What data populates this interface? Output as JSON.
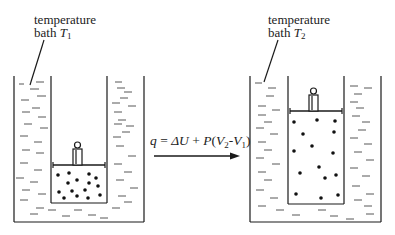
{
  "diagram": {
    "left_setup": {
      "label_line1": "temperature",
      "label_line2": "bath ",
      "temperature_symbol": "T",
      "temperature_subscript": "1",
      "state": "compressed gas, small volume"
    },
    "right_setup": {
      "label_line1": "temperature",
      "label_line2": "bath ",
      "temperature_symbol": "T",
      "temperature_subscript": "2",
      "state": "expanded gas, large volume"
    },
    "process": {
      "q": "q",
      "eq": " = ",
      "delta_u": "ΔU",
      "plus": " + ",
      "p": "P",
      "open": "(",
      "v2": "V",
      "v2_sub": "2",
      "minus": "-",
      "v1": "V",
      "v1_sub": "1",
      "close": ")",
      "arrow": "right-arrow"
    },
    "colors": {
      "ink": "#1a1a1a",
      "background": "#ffffff"
    }
  }
}
